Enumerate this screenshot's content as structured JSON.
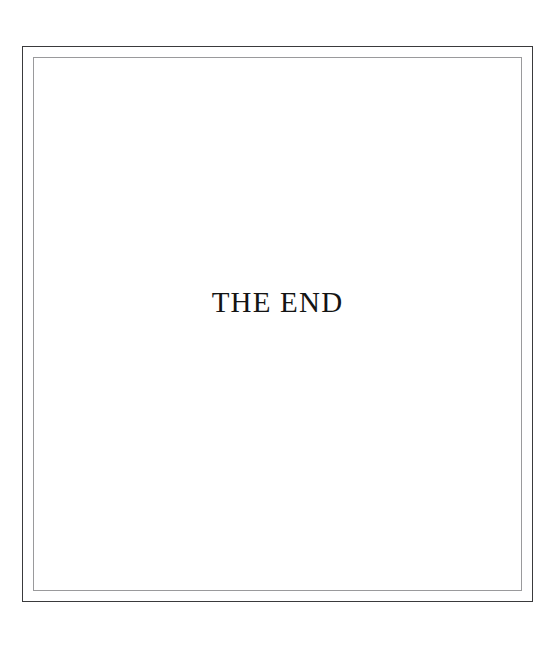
{
  "page": {
    "background_color": "#ffffff",
    "width": 558,
    "height": 652
  },
  "frame": {
    "outer_color": "#3a3a3c",
    "inner_color": "#9a9a9c",
    "style": "double-rule-border",
    "interior_color": "#ffffff"
  },
  "content": {
    "end_title": "THE END",
    "text_color": "#141414",
    "alignment": "center"
  }
}
